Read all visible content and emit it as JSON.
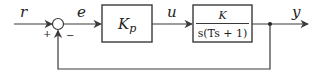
{
  "diagram": {
    "type": "feedback-control-block-diagram",
    "signals": {
      "reference": "r",
      "error": "e",
      "control": "u",
      "output": "y"
    },
    "summing_junction": {
      "plus_sign": "+",
      "minus_sign": "−"
    },
    "blocks": [
      {
        "id": "controller",
        "label_main": "K",
        "label_sub": "p"
      },
      {
        "id": "plant",
        "numerator": "K",
        "denominator": "s(Ts + 1)"
      }
    ],
    "feedback": "unity negative feedback",
    "colors": {
      "line": "#3a3a3a",
      "text": "#222222",
      "background": "#ffffff"
    }
  }
}
